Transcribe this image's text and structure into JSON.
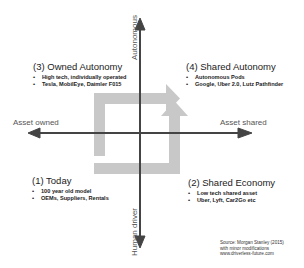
{
  "diagram": {
    "type": "2x2 quadrant matrix",
    "axes": {
      "up": "Autonomous",
      "down": "Human driver",
      "left": "Asset owned",
      "right": "Asset shared"
    },
    "quadrants": [
      {
        "id": "q3",
        "position": "top-left",
        "title": "(3) Owned Autonomy",
        "bullets": [
          "High tech, individually operated",
          "Tesla, MobilEye, Daimler F015"
        ]
      },
      {
        "id": "q4",
        "position": "top-right",
        "title": "(4) Shared Autonomy",
        "bullets": [
          "Autonomous Pods",
          "Google, Uber 2.0, Lutz Pathfinder"
        ]
      },
      {
        "id": "q1",
        "position": "bottom-left",
        "title": "(1) Today",
        "bullets": [
          "100 year old model",
          "OEMs, Suppliers, Rentals"
        ]
      },
      {
        "id": "q2",
        "position": "bottom-right",
        "title": "(2) Shared Economy",
        "bullets": [
          "Low tech shared asset",
          "Uber, Lyft, Car2Go etc"
        ]
      }
    ],
    "paths": [
      {
        "description": "From (1) Today up to (3) Owned Autonomy then right to (4) Shared Autonomy"
      },
      {
        "description": "From (1) Today right to (2) Shared Economy then up to (4) Shared Autonomy"
      }
    ],
    "source": {
      "line1": "Source: Morgan Stanley (2015)",
      "line2": "with minor modifications",
      "line3": "www.driverless-future.com"
    },
    "colors": {
      "axis": "#444444",
      "path": "#c8c8c8",
      "text": "#222222",
      "axis_label": "#555555"
    }
  }
}
